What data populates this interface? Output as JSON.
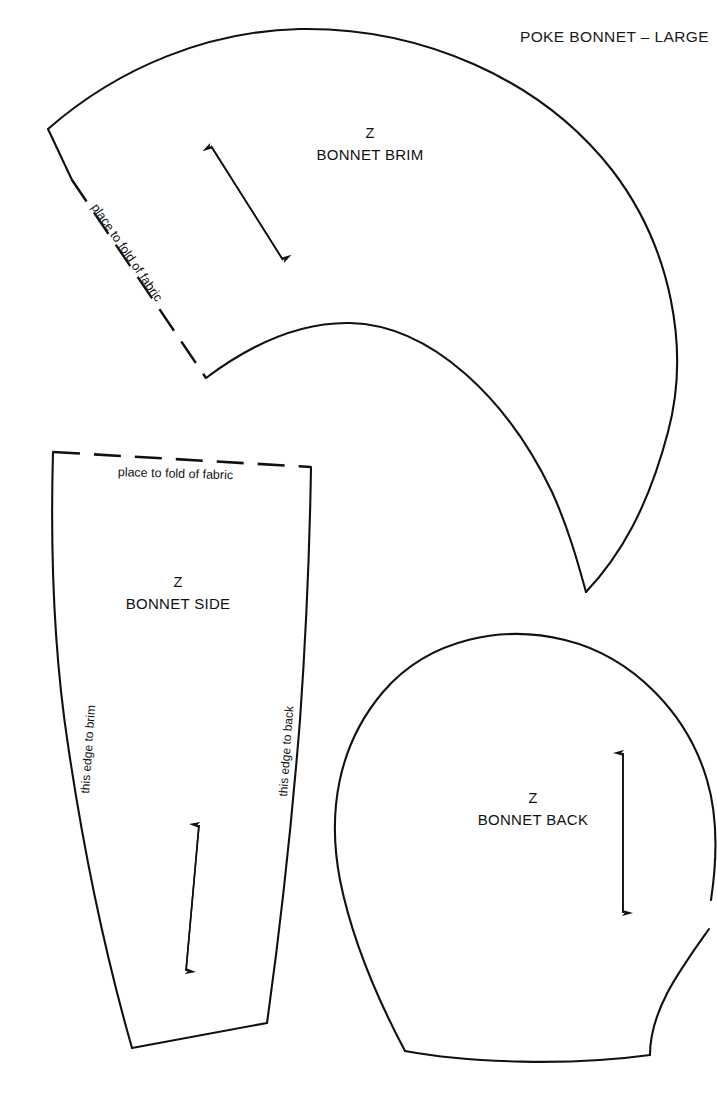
{
  "document": {
    "title": "POKE BONNET – LARGE",
    "sheet_width": 717,
    "sheet_height": 1094,
    "background_color": "#ffffff",
    "line_color": "#111111"
  },
  "pieces": {
    "brim": {
      "code": "Z",
      "name": "BONNET BRIM",
      "fold_note": "place to fold of fabric",
      "grainline": "double-headed-arrow"
    },
    "side": {
      "code": "Z",
      "name": "BONNET SIDE",
      "fold_note": "place to fold of fabric",
      "edge_left_note": "this edge to brim",
      "edge_right_note": "this edge to back",
      "grainline": "double-headed-arrow"
    },
    "back": {
      "code": "Z",
      "name": "BONNET BACK",
      "grainline": "double-headed-arrow"
    }
  }
}
